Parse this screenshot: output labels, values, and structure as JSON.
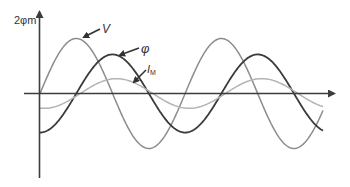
{
  "diagram": {
    "type": "waveforms",
    "y_axis_label": "2φm",
    "curves": [
      {
        "id": "V",
        "label": "V",
        "label_sub": "",
        "color": "#8c8c8c",
        "relative_amplitude": 1.0,
        "phase_lag_deg": 0
      },
      {
        "id": "phi",
        "label": "φ",
        "label_sub": "",
        "color": "#3a3a3a",
        "relative_amplitude": 0.71,
        "phase_lag_deg": 90
      },
      {
        "id": "IM",
        "label": "I",
        "label_sub": "M",
        "color": "#b4b4b4",
        "relative_amplitude": 0.27,
        "phase_lag_deg": 100
      }
    ],
    "cycles_shown": 1.95
  }
}
